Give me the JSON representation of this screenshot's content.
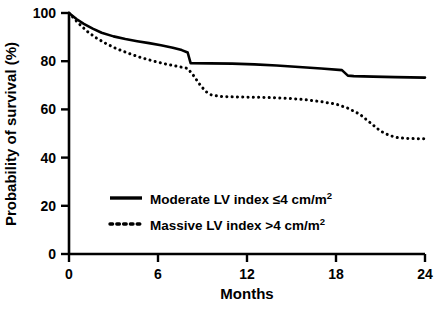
{
  "chart_data": {
    "type": "line",
    "title": "",
    "subtitle": "",
    "xlabel": "Months",
    "ylabel": "Probability of survival (%)",
    "xlim": [
      0,
      24
    ],
    "ylim": [
      0,
      100
    ],
    "xticks": [
      0,
      6,
      12,
      18,
      24
    ],
    "xtick_labels": [
      "0",
      "6",
      "12",
      "18",
      "24"
    ],
    "yticks": [
      0,
      20,
      40,
      60,
      80,
      100
    ],
    "ytick_labels": [
      "0",
      "20",
      "40",
      "60",
      "80",
      "100"
    ],
    "grid": false,
    "legend_position": "center-left-inside",
    "plot_description": "Kaplan-Meier survival curves comparing moderate versus massive left ventricular index groups over 24 months",
    "series": [
      {
        "name": "Moderate LV index ≤4 cm/m²",
        "label_main": "Moderate LV index ≤4 cm/m",
        "label_sup": "2",
        "style": "solid",
        "color": "#000000",
        "line_width": 2.6,
        "x": [
          0,
          0.5,
          1,
          1.6,
          2.2,
          3,
          3.8,
          4.6,
          5.4,
          6.2,
          7,
          7.6,
          8,
          8.2,
          9.5,
          11,
          12.5,
          14,
          15.5,
          17,
          18.4,
          18.8,
          19.2,
          20.5,
          22,
          24
        ],
        "y": [
          100,
          97.5,
          95.5,
          93.5,
          91.8,
          90.3,
          89.2,
          88.3,
          87.5,
          86.6,
          85.6,
          84.6,
          83.6,
          79.2,
          79.1,
          79.0,
          78.7,
          78.2,
          77.6,
          77.0,
          76.3,
          74.0,
          73.8,
          73.6,
          73.4,
          73.2
        ]
      },
      {
        "name": "Massive LV index >4 cm/m²",
        "label_main": "Massive LV index >4 cm/m",
        "label_sup": "2",
        "style": "dotted",
        "color": "#000000",
        "line_width": 3.0,
        "x": [
          0,
          0.6,
          1.2,
          1.8,
          2.5,
          3.2,
          4,
          4.8,
          5.6,
          6.4,
          7.2,
          8,
          8.4,
          8.8,
          9.2,
          9.6,
          10.2,
          11,
          12,
          13,
          14,
          15,
          16,
          17,
          18,
          18.8,
          19.6,
          20.4,
          21,
          21.6,
          22.2,
          23,
          24
        ],
        "y": [
          100,
          96.0,
          92.5,
          89.8,
          87.3,
          85.2,
          83.3,
          81.6,
          80.2,
          79.0,
          78.0,
          77.0,
          74.0,
          70.5,
          67.5,
          66.0,
          65.4,
          65.2,
          65.1,
          65.0,
          64.8,
          64.5,
          64.0,
          63.2,
          62.2,
          60.5,
          58.0,
          54.0,
          51.0,
          49.2,
          48.2,
          47.9,
          47.8
        ]
      }
    ]
  },
  "legend": {
    "entries": [
      {
        "sample": "solid-line-sample",
        "text": "Moderate LV index ≤4 cm/m",
        "sup": "2"
      },
      {
        "sample": "dotted-line-sample",
        "text": "Massive LV index >4 cm/m",
        "sup": "2"
      }
    ]
  },
  "axes": {
    "x_axis_label": "Months",
    "y_axis_label": "Probability of survival (%)",
    "x_tick_labels": [
      "0",
      "6",
      "12",
      "18",
      "24"
    ],
    "y_tick_labels": [
      "0",
      "20",
      "40",
      "60",
      "80",
      "100"
    ]
  },
  "colors": {
    "axis": "#000000",
    "series_moderate": "#000000",
    "series_massive": "#000000",
    "background": "#ffffff"
  }
}
